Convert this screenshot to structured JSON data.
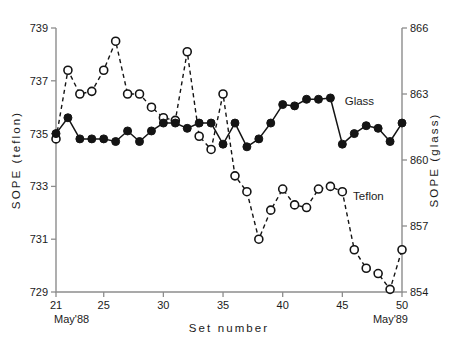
{
  "chart_data": {
    "type": "line",
    "title": "",
    "xlabel": "Set number",
    "ylabel": "SOPE (teflon)",
    "y2label": "SOPE (glass)",
    "xlim": [
      21,
      50
    ],
    "ylim": [
      729,
      739
    ],
    "y2lim": [
      854,
      866
    ],
    "grid": false,
    "legend_position": "inline-annotation",
    "x_ticks": [
      21,
      25,
      30,
      35,
      40,
      45,
      50
    ],
    "x_tick_labels": [
      "21",
      "25",
      "30",
      "35",
      "40",
      "45",
      "50"
    ],
    "y_ticks": [
      729,
      731,
      733,
      735,
      737,
      739
    ],
    "y_tick_labels": [
      "729",
      "731",
      "733",
      "735",
      "737",
      "739"
    ],
    "y2_ticks": [
      854,
      857,
      860,
      863,
      866
    ],
    "y2_tick_labels": [
      "854",
      "857",
      "860",
      "863",
      "866"
    ],
    "x_axis_start_annotation": "May'88",
    "x_axis_end_annotation": "May'89",
    "x": [
      21,
      22,
      23,
      24,
      25,
      26,
      27,
      28,
      29,
      30,
      31,
      32,
      33,
      34,
      35,
      36,
      37,
      38,
      39,
      40,
      41,
      42,
      43,
      44,
      45,
      46,
      47,
      48,
      49,
      50
    ],
    "series": [
      {
        "name": "Glass",
        "axis": "right",
        "units": "SOPE (glass)",
        "marker": "filled-circle",
        "linestyle": "solid",
        "label_text": "Glass",
        "values_left_axis": [
          735.0,
          735.6,
          734.8,
          734.8,
          734.8,
          734.7,
          735.1,
          734.7,
          735.1,
          735.4,
          735.4,
          735.2,
          735.4,
          735.4,
          734.6,
          735.4,
          734.5,
          734.8,
          735.4,
          736.1,
          736.05,
          736.3,
          736.3,
          736.35,
          734.6,
          735.0,
          735.3,
          735.2,
          734.7,
          735.4
        ],
        "values": [
          860.6,
          861.3,
          860.4,
          860.4,
          860.4,
          860.3,
          860.7,
          860.3,
          860.7,
          861.0,
          861.0,
          860.8,
          861.0,
          861.0,
          860.2,
          861.0,
          860.1,
          860.4,
          861.0,
          861.8,
          861.7,
          862.0,
          862.0,
          862.0,
          860.2,
          860.6,
          860.9,
          860.8,
          860.3,
          861.1
        ]
      },
      {
        "name": "Teflon",
        "axis": "left",
        "units": "SOPE (teflon)",
        "marker": "open-circle",
        "linestyle": "dashed",
        "label_text": "Teflon",
        "values": [
          734.8,
          737.4,
          736.5,
          736.6,
          737.4,
          738.5,
          736.5,
          736.5,
          736.0,
          735.6,
          735.5,
          738.1,
          734.9,
          734.4,
          736.5,
          733.4,
          732.8,
          731.0,
          732.1,
          732.9,
          732.3,
          732.2,
          732.9,
          733.0,
          732.8,
          730.6,
          729.9,
          729.7,
          729.1,
          730.6
        ]
      }
    ],
    "annotations": [
      {
        "text": "Glass",
        "x": 45.2,
        "y_left_axis": 736.1
      },
      {
        "text": "Teflon",
        "x": 45.9,
        "y_left_axis": 732.5
      }
    ]
  }
}
